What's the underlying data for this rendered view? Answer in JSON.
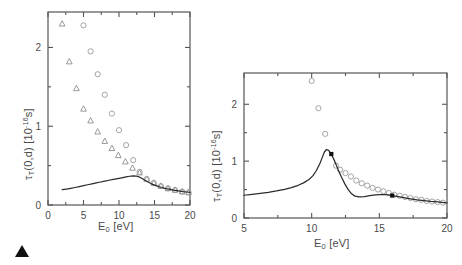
{
  "figure": {
    "caption_marker": "filled-triangle-up",
    "background_color": "#ffffff",
    "axis_color": "#555555",
    "curve_color": "#2b2b2b",
    "open_marker_color": "#9a9a9a",
    "filled_marker_color": "#111111"
  },
  "chart_data": [
    {
      "type": "scatter",
      "panel": "left",
      "title": "",
      "xlabel": "E_0 [eV]",
      "xlabel_base": "E",
      "xlabel_sub": "0",
      "xlabel_unit": "[eV]",
      "ylabel": "τ_T(0,d) [10^-16 s]",
      "ylabel_base": "τ",
      "ylabel_sub": "T",
      "ylabel_mid": "(0,d)  [10",
      "ylabel_sup": "-16",
      "ylabel_end": "s]",
      "xlim": [
        0,
        20
      ],
      "ylim": [
        0,
        2.45
      ],
      "xticks": [
        0,
        5,
        10,
        15,
        20
      ],
      "xticklabels": [
        "0",
        "5",
        "10",
        "15",
        "20"
      ],
      "xminorticks": [
        2.5,
        7.5,
        12.5,
        17.5
      ],
      "yticks": [
        0,
        1,
        2
      ],
      "yticklabels": [
        "0",
        "1",
        "2"
      ],
      "yminorticks": [
        0.5,
        1.5
      ],
      "grid": false,
      "legend": "none",
      "series": [
        {
          "name": "triangles",
          "marker": "open-triangle-up",
          "color": "#8f8f8f",
          "points": [
            [
              2.0,
              2.3
            ],
            [
              3.0,
              1.82
            ],
            [
              4.0,
              1.48
            ],
            [
              5.0,
              1.22
            ],
            [
              6.0,
              1.07
            ],
            [
              7.0,
              0.93
            ],
            [
              8.0,
              0.81
            ],
            [
              9.0,
              0.72
            ],
            [
              9.9,
              0.63
            ],
            [
              10.9,
              0.55
            ],
            [
              11.9,
              0.47
            ],
            [
              12.9,
              0.41
            ],
            [
              13.9,
              0.33
            ],
            [
              14.9,
              0.28
            ],
            [
              15.9,
              0.24
            ],
            [
              16.9,
              0.21
            ],
            [
              17.9,
              0.19
            ],
            [
              18.9,
              0.17
            ],
            [
              19.8,
              0.16
            ]
          ]
        },
        {
          "name": "circles",
          "marker": "open-circle",
          "color": "#9a9a9a",
          "points": [
            [
              5.0,
              2.28
            ],
            [
              6.0,
              1.95
            ],
            [
              7.0,
              1.66
            ],
            [
              8.0,
              1.4
            ],
            [
              9.0,
              1.16
            ],
            [
              10.0,
              0.95
            ],
            [
              11.0,
              0.76
            ],
            [
              12.0,
              0.57
            ],
            [
              12.9,
              0.42
            ],
            [
              13.9,
              0.33
            ],
            [
              14.9,
              0.28
            ],
            [
              15.9,
              0.24
            ],
            [
              16.9,
              0.21
            ],
            [
              17.9,
              0.19
            ],
            [
              18.9,
              0.17
            ],
            [
              19.8,
              0.16
            ]
          ]
        },
        {
          "name": "theory-curve",
          "marker": "line",
          "color": "#2b2b2b",
          "points": [
            [
              2.0,
              0.195
            ],
            [
              2.6,
              0.203
            ],
            [
              3.2,
              0.212
            ],
            [
              3.8,
              0.222
            ],
            [
              4.4,
              0.233
            ],
            [
              5.0,
              0.245
            ],
            [
              5.6,
              0.257
            ],
            [
              6.2,
              0.269
            ],
            [
              6.8,
              0.281
            ],
            [
              7.4,
              0.292
            ],
            [
              8.0,
              0.303
            ],
            [
              8.6,
              0.314
            ],
            [
              9.2,
              0.324
            ],
            [
              9.8,
              0.334
            ],
            [
              10.4,
              0.345
            ],
            [
              11.0,
              0.356
            ],
            [
              11.5,
              0.365
            ],
            [
              12.0,
              0.37
            ],
            [
              12.4,
              0.368
            ],
            [
              12.8,
              0.358
            ],
            [
              13.2,
              0.34
            ],
            [
              13.6,
              0.318
            ],
            [
              14.0,
              0.296
            ],
            [
              14.5,
              0.272
            ],
            [
              15.0,
              0.252
            ],
            [
              15.5,
              0.236
            ],
            [
              16.0,
              0.222
            ],
            [
              16.6,
              0.208
            ],
            [
              17.2,
              0.197
            ],
            [
              17.8,
              0.187
            ],
            [
              18.4,
              0.178
            ],
            [
              19.0,
              0.17
            ],
            [
              19.5,
              0.165
            ],
            [
              20.0,
              0.16
            ]
          ]
        }
      ]
    },
    {
      "type": "scatter",
      "panel": "right",
      "title": "",
      "xlabel": "E_0 [eV]",
      "xlabel_base": "E",
      "xlabel_sub": "0",
      "xlabel_unit": "[eV]",
      "ylabel": "τ_T(0,d) [10^-16 s]",
      "ylabel_base": "τ",
      "ylabel_sub": "T",
      "ylabel_mid": "(0,d)  [10",
      "ylabel_sup": "-16",
      "ylabel_end": "s]",
      "xlim": [
        5,
        20
      ],
      "ylim": [
        0,
        2.55
      ],
      "xticks": [
        5,
        10,
        15,
        20
      ],
      "xticklabels": [
        "5",
        "10",
        "15",
        "20"
      ],
      "xminorticks": [
        7.5,
        12.5,
        17.5
      ],
      "yticks": [
        0,
        1,
        2
      ],
      "yticklabels": [
        "0",
        "1",
        "2"
      ],
      "yminorticks": [
        0.5,
        1.5
      ],
      "grid": false,
      "legend": "none",
      "series": [
        {
          "name": "circles",
          "marker": "open-circle",
          "color": "#9a9a9a",
          "points": [
            [
              10.0,
              2.41
            ],
            [
              10.5,
              1.93
            ],
            [
              11.0,
              1.48
            ],
            [
              11.8,
              0.92
            ],
            [
              12.1,
              0.85
            ],
            [
              12.5,
              0.79
            ],
            [
              12.9,
              0.73
            ],
            [
              13.3,
              0.66
            ],
            [
              13.7,
              0.61
            ],
            [
              14.1,
              0.57
            ],
            [
              14.5,
              0.53
            ],
            [
              14.9,
              0.5
            ],
            [
              15.3,
              0.47
            ],
            [
              15.7,
              0.44
            ],
            [
              16.1,
              0.41
            ],
            [
              16.5,
              0.39
            ],
            [
              16.9,
              0.37
            ],
            [
              17.3,
              0.35
            ],
            [
              17.7,
              0.33
            ],
            [
              18.1,
              0.32
            ],
            [
              18.5,
              0.3
            ],
            [
              18.9,
              0.29
            ],
            [
              19.3,
              0.28
            ],
            [
              19.7,
              0.27
            ]
          ]
        },
        {
          "name": "theory-curve",
          "marker": "line",
          "color": "#2b2b2b",
          "points": [
            [
              5.0,
              0.4
            ],
            [
              5.6,
              0.415
            ],
            [
              6.2,
              0.432
            ],
            [
              6.8,
              0.452
            ],
            [
              7.4,
              0.476
            ],
            [
              8.0,
              0.505
            ],
            [
              8.5,
              0.535
            ],
            [
              9.0,
              0.575
            ],
            [
              9.4,
              0.618
            ],
            [
              9.8,
              0.678
            ],
            [
              10.1,
              0.745
            ],
            [
              10.35,
              0.835
            ],
            [
              10.6,
              0.955
            ],
            [
              10.8,
              1.075
            ],
            [
              10.95,
              1.165
            ],
            [
              11.1,
              1.205
            ],
            [
              11.25,
              1.19
            ],
            [
              11.45,
              1.125
            ],
            [
              11.7,
              1.0
            ],
            [
              11.95,
              0.855
            ],
            [
              12.2,
              0.72
            ],
            [
              12.45,
              0.6
            ],
            [
              12.7,
              0.5
            ],
            [
              12.95,
              0.425
            ],
            [
              13.2,
              0.385
            ],
            [
              13.5,
              0.372
            ],
            [
              13.9,
              0.378
            ],
            [
              14.3,
              0.392
            ],
            [
              14.7,
              0.405
            ],
            [
              15.1,
              0.412
            ],
            [
              15.5,
              0.41
            ],
            [
              15.9,
              0.398
            ],
            [
              16.3,
              0.38
            ],
            [
              16.8,
              0.358
            ],
            [
              17.3,
              0.338
            ],
            [
              17.8,
              0.32
            ],
            [
              18.3,
              0.305
            ],
            [
              18.8,
              0.292
            ],
            [
              19.3,
              0.282
            ],
            [
              19.8,
              0.272
            ],
            [
              20.0,
              0.268
            ]
          ]
        },
        {
          "name": "filled-markers",
          "marker": "filled-square",
          "color": "#111111",
          "points": [
            [
              11.45,
              1.125
            ],
            [
              15.95,
              0.395
            ]
          ]
        }
      ]
    }
  ]
}
